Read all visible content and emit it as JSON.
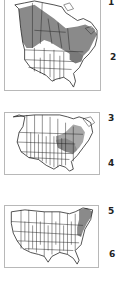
{
  "colors": {
    "range_shade": "#8a8a8a",
    "range_shade_light": "#a8a8a8",
    "outline": "#222222",
    "frame": "#b8b8b8"
  },
  "maps": [
    {
      "id": "map-north-america-full",
      "extent": "North America (Canada + USA)",
      "labels": [
        "1",
        "2"
      ]
    },
    {
      "id": "map-north-america-east",
      "extent": "Southern Canada + USA",
      "labels": [
        "3",
        "4"
      ]
    },
    {
      "id": "map-usa",
      "extent": "Contiguous USA",
      "labels": [
        "5",
        "6"
      ]
    }
  ]
}
